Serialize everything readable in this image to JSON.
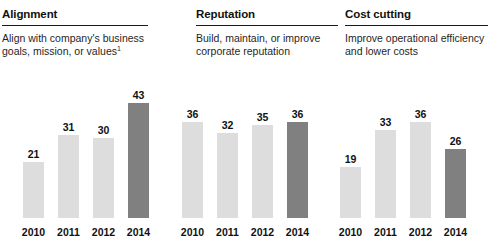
{
  "panels": [
    {
      "title": "Alignment",
      "description": "Align with company's business goals, mission, or values",
      "footnote_marker": "1"
    },
    {
      "title": "Reputation",
      "description": "Build, maintain, or improve corporate reputation",
      "footnote_marker": ""
    },
    {
      "title": "Cost cutting",
      "description": "Improve operational efficiency and lower costs",
      "footnote_marker": ""
    }
  ],
  "colors": {
    "bar_light": "#dddddd",
    "bar_highlight": "#808080",
    "text": "#111111",
    "rule": "#1a1a1a",
    "background": "#ffffff"
  },
  "chart_data": [
    {
      "type": "bar",
      "title": "Alignment",
      "xlabel": "",
      "ylabel": "",
      "categories": [
        "2010",
        "2011",
        "2012",
        "2014"
      ],
      "values": [
        21,
        31,
        30,
        43
      ],
      "highlight_index": 3,
      "ylim": [
        0,
        43
      ],
      "grid": false,
      "legend": "none"
    },
    {
      "type": "bar",
      "title": "Reputation",
      "xlabel": "",
      "ylabel": "",
      "categories": [
        "2010",
        "2011",
        "2012",
        "2014"
      ],
      "values": [
        36,
        32,
        35,
        36
      ],
      "highlight_index": 3,
      "ylim": [
        0,
        43
      ],
      "grid": false,
      "legend": "none"
    },
    {
      "type": "bar",
      "title": "Cost cutting",
      "xlabel": "",
      "ylabel": "",
      "categories": [
        "2010",
        "2011",
        "2012",
        "2014"
      ],
      "values": [
        19,
        33,
        36,
        26
      ],
      "highlight_index": 3,
      "ylim": [
        0,
        43
      ],
      "grid": false,
      "legend": "none"
    }
  ]
}
